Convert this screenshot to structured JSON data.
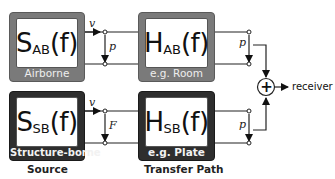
{
  "diagram": {
    "blocks": {
      "source_airborne": {
        "symbol": "S",
        "subscript": "AB",
        "arg": "(f)",
        "label": "Airborne"
      },
      "path_airborne": {
        "symbol": "H",
        "subscript": "AB",
        "arg": "(f)",
        "label": "e.g. Room"
      },
      "source_structure": {
        "symbol": "S",
        "subscript": "SB",
        "arg": "(f)",
        "label": "Structure-borne"
      },
      "path_structure": {
        "symbol": "H",
        "subscript": "SB",
        "arg": "(f)",
        "label": "e.g. Plate"
      }
    },
    "variables": {
      "top_velocity": "v",
      "top_source_pressure": "p",
      "top_output_pressure": "p",
      "bottom_velocity": "v",
      "bottom_force": "F",
      "bottom_output_pressure": "p"
    },
    "summer_symbol": "+",
    "output_label": "receiver",
    "column_captions": {
      "source": "Source",
      "transfer": "Transfer Path"
    },
    "colors": {
      "airborne_box": "#7a7a7a",
      "structure_box": "#2e2e2e",
      "line": "#222222"
    }
  }
}
